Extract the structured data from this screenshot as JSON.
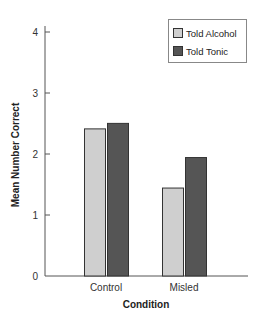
{
  "chart_data": {
    "type": "bar",
    "title": "",
    "xlabel": "Condition",
    "ylabel": "Mean Number Correct",
    "categories": [
      "Control",
      "Misled"
    ],
    "series": [
      {
        "name": "Told Alcohol",
        "values": [
          2.42,
          1.45
        ],
        "color": "#cfcfcf"
      },
      {
        "name": "Told Tonic",
        "values": [
          2.51,
          1.95
        ],
        "color": "#555555"
      }
    ],
    "ylim": [
      0,
      4
    ],
    "yticks": [
      0,
      1,
      2,
      3,
      4
    ],
    "grid": false,
    "legend_position": "top-right"
  }
}
